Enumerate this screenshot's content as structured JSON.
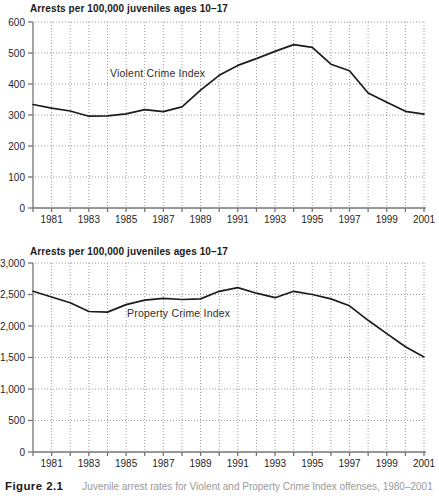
{
  "figure": {
    "caption_label": "Figure 2.1",
    "caption_text": "Juvenile arrest rates for Violent and Property Crime Index offenses, 1980–2001"
  },
  "chart_data": [
    {
      "name": "violent-crime-index",
      "type": "line",
      "title": "Arrests per 100,000 juveniles ages 10–17",
      "series_label": "Violent Crime Index",
      "xlabel": "",
      "ylabel": "Arrests per 100,000 juveniles ages 10–17",
      "x": [
        1980,
        1981,
        1982,
        1983,
        1984,
        1985,
        1986,
        1987,
        1988,
        1989,
        1990,
        1991,
        1992,
        1993,
        1994,
        1995,
        1996,
        1997,
        1998,
        1999,
        2000,
        2001
      ],
      "values": [
        334,
        322,
        313,
        296,
        297,
        304,
        317,
        311,
        326,
        380,
        428,
        460,
        482,
        505,
        527,
        518,
        464,
        443,
        371,
        341,
        312,
        303
      ],
      "ylim": [
        0,
        600
      ],
      "xlim": [
        1980,
        2001
      ],
      "y_tick_values": [
        0,
        100,
        200,
        300,
        400,
        500,
        600
      ],
      "y_tick_labels": [
        "0",
        "100",
        "200",
        "300",
        "400",
        "500",
        "600"
      ],
      "x_tick_label_years": [
        1981,
        1983,
        1985,
        1987,
        1989,
        1991,
        1993,
        1995,
        1997,
        1999,
        2001
      ],
      "x_tick_labels": [
        "1981",
        "1983",
        "1985",
        "1987",
        "1989",
        "1991",
        "1993",
        "1995",
        "1997",
        "1999",
        "2001"
      ],
      "grid": "dotted",
      "legend_position": "none",
      "colors": {
        "line": "#1c1c1c",
        "grid": "#9a9a9a",
        "axis": "#757575",
        "text": "#1f1f1f"
      }
    },
    {
      "name": "property-crime-index",
      "type": "line",
      "title": "Arrests per 100,000 juveniles ages 10–17",
      "series_label": "Property Crime Index",
      "xlabel": "",
      "ylabel": "Arrests per 100,000 juveniles ages 10–17",
      "x": [
        1980,
        1981,
        1982,
        1983,
        1984,
        1985,
        1986,
        1987,
        1988,
        1989,
        1990,
        1991,
        1992,
        1993,
        1994,
        1995,
        1996,
        1997,
        1998,
        1999,
        2000,
        2001
      ],
      "values": [
        2550,
        2460,
        2370,
        2230,
        2220,
        2340,
        2410,
        2440,
        2420,
        2430,
        2550,
        2610,
        2520,
        2450,
        2550,
        2500,
        2430,
        2320,
        2090,
        1880,
        1670,
        1510
      ],
      "ylim": [
        0,
        3000
      ],
      "xlim": [
        1980,
        2001
      ],
      "y_tick_values": [
        0,
        500,
        1000,
        1500,
        2000,
        2500,
        3000
      ],
      "y_tick_labels": [
        "0",
        "500",
        "1,000",
        "1,500",
        "2,000",
        "2,500",
        "3,000"
      ],
      "x_tick_label_years": [
        1981,
        1983,
        1985,
        1987,
        1989,
        1991,
        1993,
        1995,
        1997,
        1999,
        2001
      ],
      "x_tick_labels": [
        "1981",
        "1983",
        "1985",
        "1987",
        "1989",
        "1991",
        "1993",
        "1995",
        "1997",
        "1999",
        "2001"
      ],
      "grid": "dotted",
      "legend_position": "none",
      "colors": {
        "line": "#1c1c1c",
        "grid": "#9a9a9a",
        "axis": "#757575",
        "text": "#1f1f1f"
      }
    }
  ]
}
